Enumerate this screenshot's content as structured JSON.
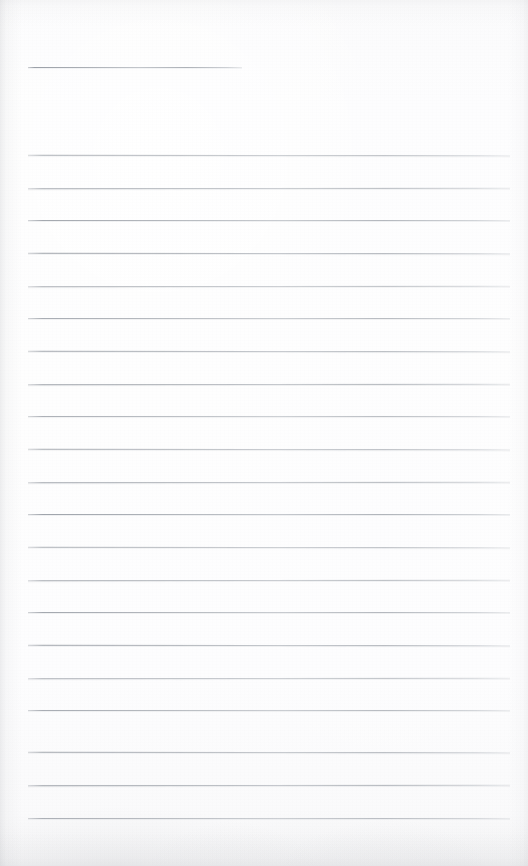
{
  "document": {
    "kind": "scanned-ruled-notepad-page",
    "title": "Blank lined notebook page",
    "text_content": "",
    "page_width": 528,
    "page_height": 866,
    "paper_color": "#fdfdfe",
    "rule_color": "#9aa0a8",
    "rule_thickness_px": 1
  },
  "rules": {
    "header_rule": {
      "label": "header-rule",
      "x": 28,
      "y": 67,
      "width": 214
    },
    "body_rules_geometry": {
      "x": 28,
      "width": 482,
      "first_y": 155,
      "spacing": 32.7,
      "count": 21
    },
    "body_rules": [
      {
        "y": 155
      },
      {
        "y": 188
      },
      {
        "y": 220
      },
      {
        "y": 253
      },
      {
        "y": 286
      },
      {
        "y": 318
      },
      {
        "y": 351
      },
      {
        "y": 384
      },
      {
        "y": 416
      },
      {
        "y": 449
      },
      {
        "y": 482
      },
      {
        "y": 514
      },
      {
        "y": 547
      },
      {
        "y": 580
      },
      {
        "y": 612
      },
      {
        "y": 645
      },
      {
        "y": 678
      },
      {
        "y": 710
      },
      {
        "y": 752
      },
      {
        "y": 785
      },
      {
        "y": 818
      }
    ]
  }
}
